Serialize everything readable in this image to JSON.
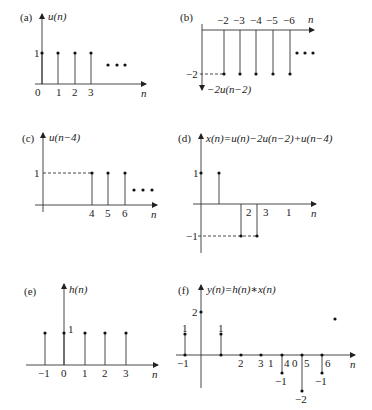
{
  "panels": {
    "a": {
      "tag": "(a)",
      "title": "u(n)",
      "ylabel_1": "1",
      "ticks": [
        "0",
        "1",
        "2",
        "3"
      ],
      "xlabel": "n",
      "samples": [
        {
          "n": 0,
          "v": 1
        },
        {
          "n": 1,
          "v": 1
        },
        {
          "n": 2,
          "v": 1
        },
        {
          "n": 3,
          "v": 1
        }
      ],
      "continues": true
    },
    "b": {
      "tag": "(b)",
      "title": "−2u(n−2)",
      "ylabel_m2": "−2",
      "ticks": [
        "−2",
        "−3",
        "−4",
        "−5",
        "−6"
      ],
      "xlabel": "n",
      "samples": [
        {
          "n": 2,
          "v": -2
        },
        {
          "n": 3,
          "v": -2
        },
        {
          "n": 4,
          "v": -2
        },
        {
          "n": 5,
          "v": -2
        },
        {
          "n": 6,
          "v": -2
        }
      ],
      "continues": true
    },
    "c": {
      "tag": "(c)",
      "title": "u(n−4)",
      "ylabel_1": "1",
      "ticks": [
        "4",
        "5",
        "6"
      ],
      "xlabel": "n",
      "samples": [
        {
          "n": 4,
          "v": 1
        },
        {
          "n": 5,
          "v": 1
        },
        {
          "n": 6,
          "v": 1
        }
      ],
      "continues": true
    },
    "d": {
      "tag": "(d)",
      "title": "x(n)=u(n)−2u(n−2)+u(n−4)",
      "ylabel_1": "1",
      "ylabel_m1": "−1",
      "ticks": [
        "2",
        "3",
        "1"
      ],
      "xlabel": "n",
      "samples": [
        {
          "n": 0,
          "v": 1
        },
        {
          "n": 1,
          "v": 1
        },
        {
          "n": 2,
          "v": -1
        },
        {
          "n": 3,
          "v": -1
        }
      ]
    },
    "e": {
      "tag": "(e)",
      "title": "h(n)",
      "ylabel_1": "1",
      "ticks": [
        "−1",
        "0",
        "1",
        "2",
        "3"
      ],
      "xlabel": "n",
      "samples": [
        {
          "n": -1,
          "v": 1
        },
        {
          "n": 0,
          "v": 1
        },
        {
          "n": 1,
          "v": 1
        },
        {
          "n": 2,
          "v": 1
        },
        {
          "n": 3,
          "v": 1
        }
      ]
    },
    "f": {
      "tag": "(f)",
      "title": "y(n)=h(n)∗x(n)",
      "value_labels": [
        "1",
        "2",
        "1",
        "−1",
        "−2",
        "−1"
      ],
      "ticks": [
        "−1",
        "2",
        "3",
        "1",
        "4",
        "0",
        "5",
        "6"
      ],
      "xlabel": "n",
      "samples": [
        {
          "n": -1,
          "v": 1
        },
        {
          "n": 0,
          "v": 2
        },
        {
          "n": 1,
          "v": 1
        },
        {
          "n": 2,
          "v": 0
        },
        {
          "n": 3,
          "v": 0
        },
        {
          "n": 4,
          "v": -1
        },
        {
          "n": 5,
          "v": -2
        },
        {
          "n": 6,
          "v": -1
        }
      ]
    }
  }
}
